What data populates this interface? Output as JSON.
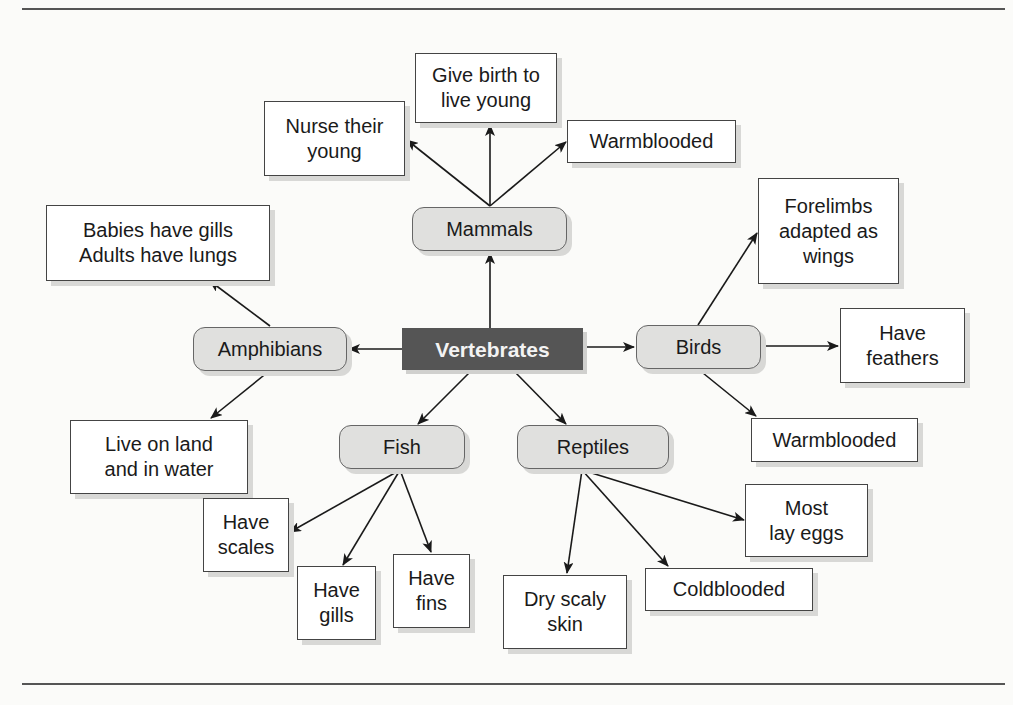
{
  "root": {
    "label": "Vertebrates",
    "fill": "#555555"
  },
  "categories": {
    "mammals": {
      "label": "Mammals"
    },
    "amphibians": {
      "label": "Amphibians"
    },
    "birds": {
      "label": "Birds"
    },
    "fish": {
      "label": "Fish"
    },
    "reptiles": {
      "label": "Reptiles"
    }
  },
  "traits": {
    "mammals": [
      {
        "label": "Give birth to\nlive young"
      },
      {
        "label": "Nurse their\nyoung"
      },
      {
        "label": "Warmblooded"
      }
    ],
    "amphibians": [
      {
        "label": "Babies have gills\nAdults have lungs"
      },
      {
        "label": "Live on land\nand in water"
      }
    ],
    "birds": [
      {
        "label": "Forelimbs\nadapted as\nwings"
      },
      {
        "label": "Have\nfeathers"
      },
      {
        "label": "Warmblooded"
      }
    ],
    "fish": [
      {
        "label": "Have\nscales"
      },
      {
        "label": "Have\ngills"
      },
      {
        "label": "Have\nfins"
      }
    ],
    "reptiles": [
      {
        "label": "Most\nlay eggs"
      },
      {
        "label": "Coldblooded"
      },
      {
        "label": "Dry scaly\nskin"
      }
    ]
  }
}
